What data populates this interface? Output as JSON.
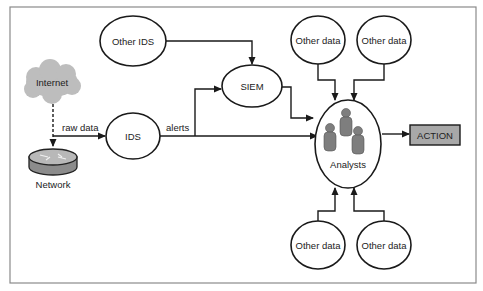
{
  "diagram": {
    "title": "",
    "nodes": {
      "other_ids": {
        "label": "Other IDS",
        "shape": "ellipse"
      },
      "siem": {
        "label": "SIEM",
        "shape": "ellipse"
      },
      "ids": {
        "label": "IDS",
        "shape": "ellipse"
      },
      "internet": {
        "label": "Internet",
        "shape": "cloud-icon"
      },
      "network": {
        "label": "Network",
        "shape": "router-icon"
      },
      "analysts": {
        "label": "Analysts",
        "shape": "ellipse",
        "icon": "people-group-icon"
      },
      "action": {
        "label": "ACTION",
        "shape": "rectangle"
      },
      "other_data_top_left": {
        "label": "Other data",
        "shape": "ellipse"
      },
      "other_data_top_right": {
        "label": "Other data",
        "shape": "ellipse"
      },
      "other_data_bottom_left": {
        "label": "Other data",
        "shape": "ellipse"
      },
      "other_data_bottom_right": {
        "label": "Other data",
        "shape": "ellipse"
      }
    },
    "edges": [
      {
        "from": "internet",
        "to": "network",
        "style": "dashed",
        "label": ""
      },
      {
        "from": "internet",
        "to": "ids",
        "style": "solid",
        "label": "raw data"
      },
      {
        "from": "ids",
        "to": "siem",
        "style": "solid",
        "label": "alerts"
      },
      {
        "from": "ids",
        "to": "analysts",
        "style": "solid",
        "label": ""
      },
      {
        "from": "other_ids",
        "to": "siem",
        "style": "solid",
        "label": ""
      },
      {
        "from": "siem",
        "to": "analysts",
        "style": "solid",
        "label": ""
      },
      {
        "from": "other_data_top_left",
        "to": "analysts",
        "style": "solid",
        "label": ""
      },
      {
        "from": "other_data_top_right",
        "to": "analysts",
        "style": "solid",
        "label": ""
      },
      {
        "from": "other_data_bottom_left",
        "to": "analysts",
        "style": "solid",
        "label": ""
      },
      {
        "from": "other_data_bottom_right",
        "to": "analysts",
        "style": "solid",
        "label": ""
      },
      {
        "from": "analysts",
        "to": "action",
        "style": "solid",
        "label": ""
      }
    ],
    "edge_labels": {
      "raw_data": "raw data",
      "alerts": "alerts"
    },
    "colors": {
      "stroke": "#1a1a1a",
      "action_fill": "#a8a8a8",
      "cloud_fill": "#bdbdbd",
      "person_fill": "#7e7e7e",
      "frame": "#8a8a8a"
    }
  }
}
